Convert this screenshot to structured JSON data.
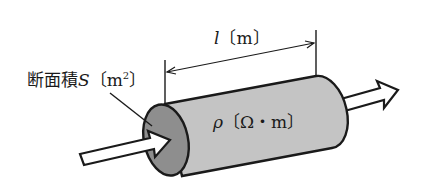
{
  "diagram": {
    "type": "resistor-cylinder",
    "labels": {
      "cross_section_prefix": "断面積",
      "cross_section_symbol": "S",
      "cross_section_unit_open": "〔m",
      "cross_section_unit_exp": "2",
      "cross_section_unit_close": "〕",
      "length_symbol": "l",
      "length_unit": "〔m〕",
      "resistivity_symbol": "ρ",
      "resistivity_unit": "〔Ω・m〕"
    },
    "colors": {
      "cylinder_body": "#c4c4c4",
      "end_face": "#8e8e8e",
      "outline": "#1a1a1a",
      "arrow_fill": "#ffffff"
    }
  }
}
